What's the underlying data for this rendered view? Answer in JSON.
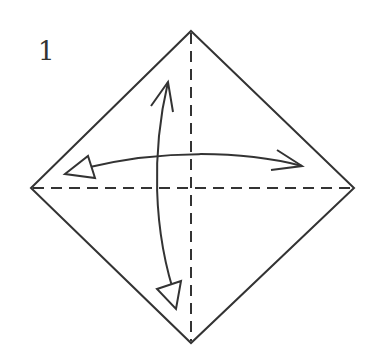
{
  "diagram": {
    "type": "origami-step",
    "step_number": "1",
    "colors": {
      "line": "#333333",
      "background": "#ffffff"
    },
    "square": {
      "shape": "diamond",
      "vertices": {
        "top": [
          191,
          31
        ],
        "right": [
          354,
          188
        ],
        "bottom": [
          191,
          343
        ],
        "left": [
          31,
          188
        ]
      }
    },
    "folds": [
      {
        "name": "vertical-valley-fold",
        "style": "dashed",
        "from": [
          191,
          31
        ],
        "to": [
          191,
          343
        ]
      },
      {
        "name": "horizontal-valley-fold",
        "style": "dashed",
        "from": [
          31,
          188
        ],
        "to": [
          354,
          188
        ]
      }
    ],
    "arrows": [
      {
        "name": "fold-and-unfold-vertical",
        "meaning": "fold in half and unfold",
        "start_head": "open",
        "end_head": "hollow-triangle"
      },
      {
        "name": "fold-and-unfold-horizontal",
        "meaning": "fold in half and unfold",
        "start_head": "hollow-triangle",
        "end_head": "open"
      }
    ]
  }
}
